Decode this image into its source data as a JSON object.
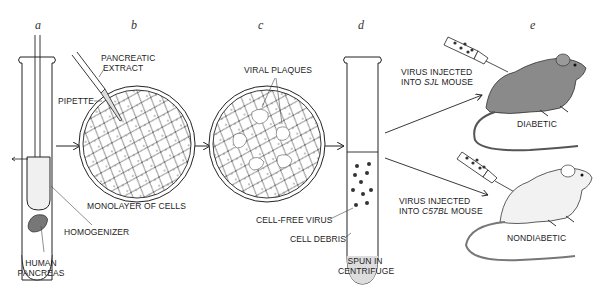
{
  "steps": [
    {
      "letter": "a"
    },
    {
      "letter": "b"
    },
    {
      "letter": "c"
    },
    {
      "letter": "d"
    },
    {
      "letter": "e"
    }
  ],
  "labels": {
    "human_pancreas_1": "HUMAN",
    "human_pancreas_2": "PANCREAS",
    "homogenizer": "HOMOGENIZER",
    "pancreatic_extract_1": "PANCREATIC",
    "pancreatic_extract_2": "EXTRACT",
    "pipette": "PIPETTE",
    "monolayer": "MONOLAYER OF CELLS",
    "viral_plaques": "VIRAL PLAQUES",
    "cell_free_virus": "CELL-FREE VIRUS",
    "cell_debris": "CELL DEBRIS",
    "spun_1": "SPUN IN",
    "spun_2": "CENTRIFUGE",
    "sjl_line1": "VIRUS INJECTED",
    "sjl_line2_prefix": "INTO ",
    "sjl_strain": "SJL",
    "sjl_line2_suffix": " MOUSE",
    "diabetic": "DIABETIC",
    "c57_line1": "VIRUS INJECTED",
    "c57_line2_prefix": "INTO ",
    "c57_strain": "C57BL",
    "c57_line2_suffix": " MOUSE",
    "nondiabetic": "NONDIABETIC"
  },
  "colors": {
    "ink": "#222222",
    "mouse_dark": "#8a8a8a",
    "mouse_light": "#f2f2f2",
    "debris": "#d8d8d8"
  }
}
